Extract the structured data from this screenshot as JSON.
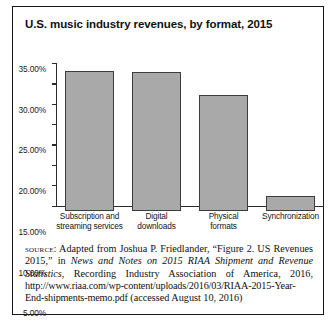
{
  "figure": {
    "title": "U.S. music industry revenues, by format, 2015"
  },
  "chart_data": {
    "type": "bar",
    "title": "U.S. music industry revenues, by format, 2015",
    "xlabel": "",
    "ylabel": "",
    "ylim": [
      0,
      35
    ],
    "grid": false,
    "legend": null,
    "categories": [
      "Subscription and streaming services",
      "Digital downloads",
      "Physical formats",
      "Synchronization"
    ],
    "category_lines": [
      [
        "Subscription and",
        "streaming services"
      ],
      [
        "Digital",
        "downloads"
      ],
      [
        "Physical",
        "formats"
      ],
      [
        "Synchronization"
      ]
    ],
    "values": [
      34.3,
      34.0,
      28.4,
      3.7
    ],
    "value_labels": [
      "34.30%",
      "34.00%",
      "28.40%",
      "3.70%"
    ],
    "y_ticks": [
      0,
      5,
      10,
      15,
      20,
      25,
      30,
      35
    ],
    "y_tick_labels": [
      "0.00%",
      "5.00%",
      "10.00%",
      "15.00%",
      "20.00%",
      "25.00%",
      "30.00%",
      "35.00%"
    ],
    "bar_color": "#a9a9a9",
    "bar_border_color": "#3d3d3d",
    "axis_color": "#2b2b2b"
  },
  "source": {
    "label": "source:",
    "text_part1": " Adapted from Joshua P. Friedlander, “Figure 2. US Revenues 2015,” in ",
    "italic1": "News and Notes on 2015 RIAA Shipment and Revenue Statistics",
    "text_part2": ", Recording Industry Association of America, 2016, ",
    "url": "http://www.riaa.com/wp-content/uploads/2016/03/RIAA-2015-Year-End-shipments-memo.pdf",
    "text_part3": " (accessed August 10, 2016)"
  }
}
